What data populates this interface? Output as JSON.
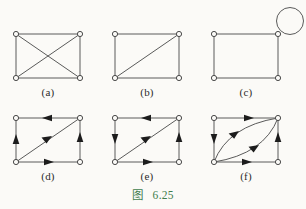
{
  "figure": {
    "caption_prefix": "图",
    "caption_number": "6.25",
    "caption_color": "#3f7d4e",
    "background_color": "#fbfaf7",
    "line_color": "#5a5a5a",
    "vertex_fill": "#fbfaf7",
    "arrow_color": "#1c1c1c"
  },
  "panels": [
    {
      "id": "a",
      "label": "(a)",
      "directed": false,
      "description": "square with both diagonals",
      "vertices": [
        "top-left",
        "top-right",
        "bottom-left",
        "bottom-right"
      ],
      "edges": [
        "top-left -- top-right",
        "top-left -- bottom-left",
        "top-right -- bottom-right",
        "bottom-left -- bottom-right",
        "top-left -- bottom-right",
        "top-right -- bottom-left"
      ]
    },
    {
      "id": "b",
      "label": "(b)",
      "directed": false,
      "description": "square with one diagonal",
      "vertices": [
        "top-left",
        "top-right",
        "bottom-left",
        "bottom-right"
      ],
      "edges": [
        "top-left -- top-right",
        "top-left -- bottom-left",
        "top-right -- bottom-right",
        "bottom-left -- bottom-right",
        "bottom-left -- top-right"
      ]
    },
    {
      "id": "c",
      "label": "(c)",
      "directed": false,
      "description": "square with self-loop at top-right vertex",
      "vertices": [
        "top-left",
        "top-right",
        "bottom-left",
        "bottom-right"
      ],
      "edges": [
        "top-left -- top-right",
        "top-left -- bottom-left",
        "top-right -- bottom-right",
        "bottom-left -- bottom-right",
        "top-right -- top-right (self loop)"
      ]
    },
    {
      "id": "d",
      "label": "(d)",
      "directed": true,
      "description": "directed square with one diagonal",
      "vertices": [
        "top-left",
        "top-right",
        "bottom-left",
        "bottom-right"
      ],
      "edges": [
        "top-right -> top-left",
        "bottom-left -> top-left",
        "bottom-right -> top-right",
        "bottom-left -> bottom-right",
        "bottom-left -> top-right"
      ]
    },
    {
      "id": "e",
      "label": "(e)",
      "directed": true,
      "description": "directed square with one diagonal, left edge reversed",
      "vertices": [
        "top-left",
        "top-right",
        "bottom-left",
        "bottom-right"
      ],
      "edges": [
        "top-right -> top-left",
        "top-left -> bottom-left",
        "bottom-right -> top-right",
        "bottom-left -> bottom-right",
        "bottom-left -> top-right"
      ]
    },
    {
      "id": "f",
      "label": "(f)",
      "directed": true,
      "description": "directed square with two parallel curved diagonal arcs",
      "vertices": [
        "top-left",
        "top-right",
        "bottom-left",
        "bottom-right"
      ],
      "edges": [
        "top-left -> top-right",
        "top-left -> bottom-left",
        "bottom-right -> top-right",
        "bottom-left -> bottom-right",
        "bottom-left -> top-right (upper arc)",
        "bottom-left -> top-right (lower arc)"
      ]
    }
  ]
}
